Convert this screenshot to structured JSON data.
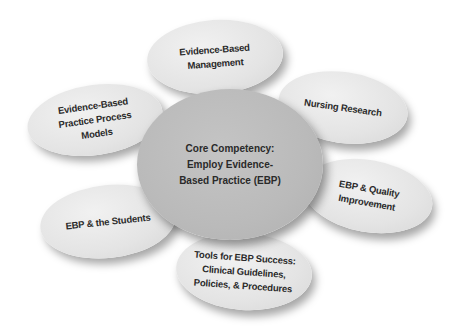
{
  "diagram": {
    "type": "hub-and-spoke",
    "center": {
      "label": "Core Competency:\nEmploy Evidence-\nBased Practice (EBP)",
      "fill": "#bcbcbc"
    },
    "nodes": [
      {
        "id": "management",
        "label": "Evidence-Based\nManagement"
      },
      {
        "id": "research",
        "label": "Nursing Research"
      },
      {
        "id": "quality",
        "label": "EBP & Quality\nImprovement"
      },
      {
        "id": "tools",
        "label": "Tools for EBP Success:\nClinical Guidelines,\nPolicies, & Procedures"
      },
      {
        "id": "students",
        "label": "EBP & the Students"
      },
      {
        "id": "process-models",
        "label": "Evidence-Based\nPractice Process\nModels"
      }
    ],
    "colors": {
      "outer_fill": "#e6e6e6",
      "center_fill": "#bcbcbc",
      "text": "#2a2a2a",
      "background": "#ffffff"
    }
  }
}
